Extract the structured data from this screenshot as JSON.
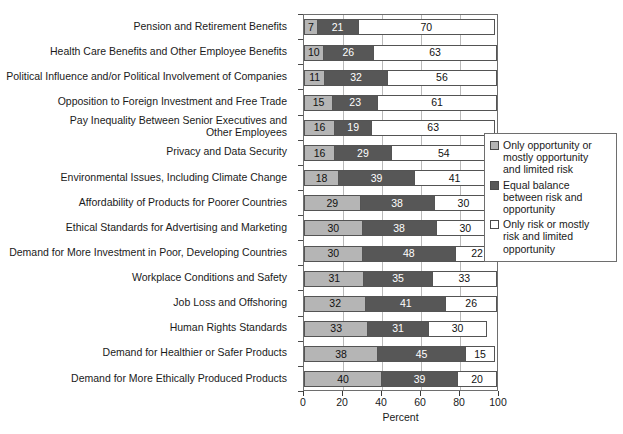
{
  "chart_data": {
    "type": "bar",
    "subtype": "horizontal-stacked-100",
    "title": "",
    "xlabel": "Percent",
    "ylabel": "",
    "xlim": [
      0,
      100
    ],
    "xticks": [
      0,
      20,
      40,
      60,
      80,
      100
    ],
    "grid": true,
    "legend_position": "right",
    "categories": [
      "Pension and Retirement Benefits",
      "Health Care Benefits and Other Employee Benefits",
      "Political Influence and/or Political Involvement of Companies",
      "Opposition to Foreign Investment and Free Trade",
      "Pay Inequality Between Senior Executives and\nOther Employees",
      "Privacy and Data Security",
      "Environmental Issues, Including Climate Change",
      "Affordability of Products for Poorer Countries",
      "Ethical Standards for Advertising and Marketing",
      "Demand for More Investment in Poor, Developing Countries",
      "Workplace Conditions and Safety",
      "Job Loss and Offshoring",
      "Human Rights Standards",
      "Demand for Healthier or Safer Products",
      "Demand for More Ethically Produced Products"
    ],
    "series": [
      {
        "name": "Only opportunity or mostly opportunity and limited risk",
        "color": "#b5b5b5",
        "values": [
          7,
          10,
          11,
          15,
          16,
          16,
          18,
          29,
          30,
          30,
          31,
          32,
          33,
          38,
          40
        ]
      },
      {
        "name": "Equal balance between risk and opportunity",
        "color": "#575757",
        "values": [
          21,
          26,
          32,
          23,
          19,
          29,
          39,
          38,
          38,
          48,
          35,
          41,
          31,
          45,
          39
        ]
      },
      {
        "name": "Only risk or mostly risk and limited opportunity",
        "color": "#ffffff",
        "values": [
          70,
          63,
          56,
          61,
          63,
          54,
          41,
          30,
          30,
          22,
          33,
          26,
          30,
          15,
          20
        ]
      }
    ]
  },
  "legend": {
    "items": [
      {
        "label": "Only opportunity or\nmostly opportunity\nand limited risk",
        "swatch": "light-gray"
      },
      {
        "label": "Equal balance\nbetween risk and\nopportunity",
        "swatch": "dark-gray"
      },
      {
        "label": "Only risk or mostly\nrisk and limited\nopportunity",
        "swatch": "white"
      }
    ]
  },
  "axis": {
    "x_title": "Percent",
    "x_tick_labels": [
      "0",
      "20",
      "40",
      "60",
      "80",
      "100"
    ]
  },
  "colors": {
    "series_opportunity": "#b5b5b5",
    "series_balance": "#575757",
    "series_risk": "#ffffff",
    "frame": "#6e6e6e",
    "grid": "#b9b9b9"
  }
}
